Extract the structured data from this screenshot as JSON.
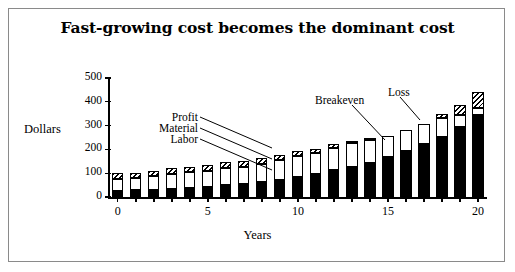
{
  "figure": {
    "title": "Fast-growing cost becomes the dominant cost",
    "border_color": "#8a8a8a",
    "background": "#ffffff"
  },
  "axes": {
    "ylabel": "Dollars",
    "xlabel": "Years",
    "yticks": [
      0,
      100,
      200,
      300,
      400,
      500
    ],
    "ytick_labels": [
      "0",
      "100",
      "200",
      "300",
      "400",
      "500"
    ],
    "xticks": [
      0,
      5,
      10,
      15,
      20
    ],
    "xtick_labels": [
      "0",
      "5",
      "10",
      "15",
      "20"
    ]
  },
  "annotations": [
    {
      "name": "profit",
      "text": "Profit"
    },
    {
      "name": "material",
      "text": "Material"
    },
    {
      "name": "labor",
      "text": "Labor"
    },
    {
      "name": "breakeven",
      "text": "Breakeven"
    },
    {
      "name": "loss",
      "text": "Loss"
    }
  ],
  "chart_data": {
    "type": "bar",
    "subtype": "stacked",
    "title": "Fast-growing cost becomes the dominant cost",
    "xlabel": "Years",
    "ylabel": "Dollars",
    "ylim": [
      0,
      500
    ],
    "xlim": [
      -0.7,
      20.7
    ],
    "grid": false,
    "legend": "none",
    "categories": [
      0,
      1,
      2,
      3,
      4,
      5,
      6,
      7,
      8,
      9,
      10,
      11,
      12,
      13,
      14,
      15,
      16,
      17,
      18,
      19,
      20
    ],
    "series": [
      {
        "name": "Labor",
        "fill": "solid-black",
        "values": [
          25,
          28,
          31,
          35,
          39,
          44,
          49,
          56,
          63,
          72,
          84,
          97,
          112,
          128,
          144,
          168,
          194,
          221,
          252,
          295,
          345
        ]
      },
      {
        "name": "Material",
        "fill": "white",
        "values": [
          50,
          53,
          57,
          61,
          66,
          66,
          72,
          71,
          76,
          82,
          90,
          89,
          93,
          97,
          96,
          90,
          88,
          85,
          78,
          48,
          30
        ]
      },
      {
        "name": "Profit",
        "fill": "hatched",
        "values": [
          25,
          21,
          22,
          24,
          22,
          24,
          24,
          23,
          25,
          22,
          18,
          17,
          16,
          12,
          8,
          0,
          0,
          0,
          18,
          45,
          65
        ]
      }
    ],
    "totals": [
      100,
      102,
      110,
      120,
      127,
      134,
      145,
      150,
      164,
      176,
      192,
      203,
      221,
      237,
      248,
      258,
      282,
      306,
      348,
      388,
      440
    ],
    "notes": {
      "breakeven": "Profit layer vanishes near year 15 (breakeven)",
      "loss": "Bars at years 15-17 show no profit band (loss region)"
    }
  }
}
